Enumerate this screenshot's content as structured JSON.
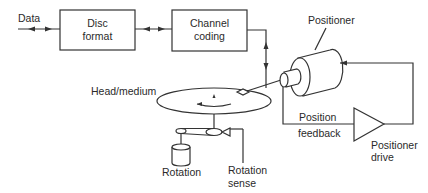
{
  "diagram": {
    "blocks": [
      {
        "id": "disc-format",
        "line1": "Disc",
        "line2": "format"
      },
      {
        "id": "channel-coding",
        "line1": "Channel",
        "line2": "coding"
      }
    ],
    "labels": {
      "data": "Data",
      "positioner": "Positioner",
      "head_medium": "Head/medium",
      "position": "Position",
      "feedback": "feedback",
      "positioner_drive_1": "Positioner",
      "positioner_drive_2": "drive",
      "rotation": "Rotation",
      "rotation_sense_1": "Rotation",
      "rotation_sense_2": "sense"
    },
    "colors": {
      "line": "#333333",
      "background": "#ffffff"
    }
  }
}
